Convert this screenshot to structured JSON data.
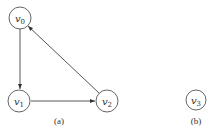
{
  "diagram": {
    "type": "directed-graph",
    "colors": {
      "stroke": "#555555",
      "text": "#333333",
      "background": "#ffffff"
    },
    "subfigures": [
      {
        "id": "a",
        "caption": "(a)",
        "nodes": [
          {
            "id": "v0",
            "base": "v",
            "sub": "0"
          },
          {
            "id": "v1",
            "base": "v",
            "sub": "1"
          },
          {
            "id": "v2",
            "base": "v",
            "sub": "2"
          }
        ],
        "edges": [
          {
            "from": "v0",
            "to": "v1"
          },
          {
            "from": "v1",
            "to": "v2"
          },
          {
            "from": "v2",
            "to": "v0"
          }
        ]
      },
      {
        "id": "b",
        "caption": "(b)",
        "nodes": [
          {
            "id": "v3",
            "base": "v",
            "sub": "3"
          }
        ],
        "edges": []
      }
    ]
  }
}
